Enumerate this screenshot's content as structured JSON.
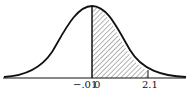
{
  "figure": {
    "type": "normal-distribution-curve",
    "shaded_region": {
      "from": 0,
      "to": 2.1
    },
    "labels": {
      "neg": "−.01",
      "zero": "0",
      "right": "2.1"
    },
    "colors": {
      "stroke": "#111111",
      "hatch": "#333333",
      "background": "#ffffff"
    }
  }
}
